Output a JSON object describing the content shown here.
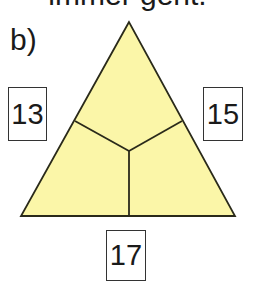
{
  "header": {
    "partial_text": "immer geht."
  },
  "exercise": {
    "label": "b)"
  },
  "triangle": {
    "fill_color": "#fbf6a8",
    "stroke_color": "#2a2a1a",
    "regions": 3
  },
  "numbers": {
    "left": "13",
    "right": "15",
    "bottom": "17"
  }
}
